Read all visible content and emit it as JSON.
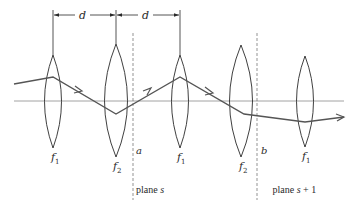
{
  "figure": {
    "colors": {
      "background": "#ffffff",
      "lens_stroke": "#2a2a2a",
      "ray": "#555555",
      "axis": "#8a8a8a",
      "plane_line": "#666666",
      "text": "#2a2a2a"
    },
    "spacing_label": "d",
    "spacing_markers": [
      {
        "from_lens": "f1",
        "to_lens": "f2",
        "label": "d"
      },
      {
        "from_lens": "f2",
        "to_lens": "f1",
        "label": "d"
      }
    ],
    "lenses": [
      {
        "id": "lens-1",
        "label_main": "f",
        "label_sub": "1"
      },
      {
        "id": "lens-2",
        "label_main": "f",
        "label_sub": "2"
      },
      {
        "id": "lens-3",
        "label_main": "f",
        "label_sub": "1"
      },
      {
        "id": "lens-4",
        "label_main": "f",
        "label_sub": "2"
      },
      {
        "id": "lens-5",
        "label_main": "f",
        "label_sub": "1"
      }
    ],
    "planes": [
      {
        "id": "plane-a",
        "point_label": "a",
        "name_prefix": "plane ",
        "name_var": "s",
        "name_suffix": ""
      },
      {
        "id": "plane-b",
        "point_label": "b",
        "name_prefix": "plane ",
        "name_var": "s",
        "name_suffix": " + 1"
      }
    ],
    "ray": {
      "description": "zigzag ray path through lenses",
      "arrows": 4
    }
  }
}
